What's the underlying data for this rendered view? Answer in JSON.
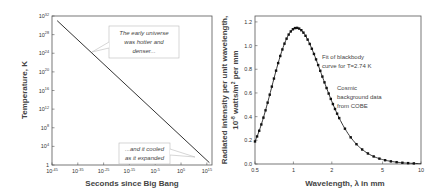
{
  "chart_data": [
    {
      "type": "line",
      "title": "",
      "xlabel": "Seconds since Big Bang",
      "ylabel": "Temperature, K",
      "xscale": "log",
      "yscale": "log",
      "x_ticks": [
        "10^-45",
        "10^-35",
        "10^-25",
        "10^-15",
        "10^-5",
        "10^5",
        "10^15"
      ],
      "x_tick_exps": [
        -45,
        -35,
        -25,
        -15,
        -5,
        5,
        15
      ],
      "y_ticks": [
        "1",
        "10^4",
        "10^8",
        "10^12",
        "10^16",
        "10^20",
        "10^24",
        "10^28",
        "10^32"
      ],
      "y_tick_exps": [
        0,
        4,
        8,
        12,
        16,
        20,
        24,
        28,
        32
      ],
      "xlim_exp": [
        -45,
        17
      ],
      "ylim_exp": [
        0,
        32
      ],
      "series": [
        {
          "name": "Temperature",
          "x_exp": [
            -43,
            16
          ],
          "y_exp": [
            31,
            0.5
          ]
        }
      ],
      "annotations": [
        {
          "text": [
            "The early universe",
            "was hotter and",
            "denser..."
          ]
        },
        {
          "text": [
            "...and it cooled",
            "as it expanded"
          ]
        }
      ],
      "grid": false
    },
    {
      "type": "line",
      "title": "",
      "xlabel": "Wavelength, λ in mm",
      "ylabel_line1": "Radiated intensity per unit wavelength,",
      "ylabel_line2": "10^-8 watts/m^2 per mm",
      "xscale": "log",
      "x_ticks": [
        "0.5",
        "1",
        "2",
        "5",
        "10"
      ],
      "x_tick_vals": [
        0.5,
        1,
        2,
        5,
        10
      ],
      "y_ticks": [
        "0.0",
        "0.2",
        "0.4",
        "0.6",
        "0.8",
        "1.0",
        "1.2"
      ],
      "y_tick_vals": [
        0,
        0.2,
        0.4,
        0.6,
        0.8,
        1.0,
        1.2
      ],
      "xlim": [
        0.5,
        10
      ],
      "ylim": [
        0,
        1.25
      ],
      "series": [
        {
          "name": "Fit of blackbody curve for T=2.74 K",
          "style": "line",
          "temperature_K": 2.74
        },
        {
          "name": "Cosmic background data from COBE",
          "style": "markers"
        }
      ],
      "annotations": [
        {
          "text": [
            "Fit of blackbody",
            "curve for T=2.74 K"
          ]
        },
        {
          "text": [
            "Cosmic",
            "background data",
            "from COBE"
          ]
        }
      ],
      "peak": {
        "x": 1.0,
        "y": 1.15
      },
      "grid": false
    }
  ]
}
